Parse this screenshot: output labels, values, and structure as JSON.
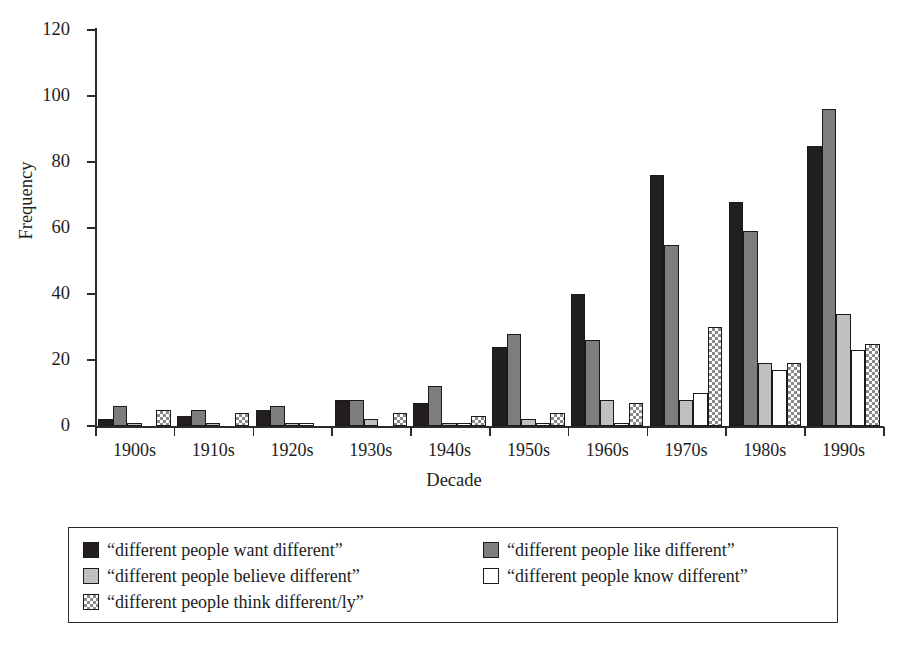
{
  "chart_data": {
    "type": "bar",
    "title": "",
    "xlabel": "Decade",
    "ylabel": "Frequency",
    "ylim": [
      0,
      120
    ],
    "yticks": [
      0,
      20,
      40,
      60,
      80,
      100,
      120
    ],
    "grid": false,
    "legend_position": "bottom",
    "categories": [
      "1900s",
      "1910s",
      "1920s",
      "1930s",
      "1940s",
      "1950s",
      "1960s",
      "1970s",
      "1980s",
      "1990s"
    ],
    "series": [
      {
        "name": "“different people want different”",
        "fill": "black",
        "color": "#231f20",
        "values": [
          2,
          3,
          5,
          8,
          7,
          24,
          40,
          76,
          68,
          85
        ]
      },
      {
        "name": "“different people like different”",
        "fill": "dark-gray",
        "color": "#7d7d7d",
        "values": [
          6,
          5,
          6,
          8,
          12,
          28,
          26,
          55,
          59,
          96
        ]
      },
      {
        "name": "“different people believe different”",
        "fill": "light-gray",
        "color": "#c0c0c0",
        "values": [
          1,
          1,
          1,
          2,
          1,
          2,
          8,
          8,
          19,
          34
        ]
      },
      {
        "name": "“different people know different”",
        "fill": "white",
        "color": "#ffffff",
        "values": [
          0,
          0,
          1,
          0,
          1,
          1,
          1,
          10,
          17,
          23
        ]
      },
      {
        "name": "“different people think different/ly”",
        "fill": "checkered",
        "color": "#8a8a8a",
        "values": [
          5,
          4,
          0,
          4,
          3,
          4,
          7,
          30,
          19,
          25
        ]
      }
    ]
  },
  "axes": {
    "y_title": "Frequency",
    "x_title": "Decade",
    "y_tick_labels": [
      "0",
      "20",
      "40",
      "60",
      "80",
      "100",
      "120"
    ],
    "x_tick_labels": [
      "1900s",
      "1910s",
      "1920s",
      "1930s",
      "1940s",
      "1950s",
      "1960s",
      "1970s",
      "1980s",
      "1990s"
    ]
  },
  "legend": {
    "left_column": [
      {
        "label": "“different people want different”",
        "swatch": "black"
      },
      {
        "label": "“different people believe different”",
        "swatch": "light-gray"
      },
      {
        "label": "“different people think different/ly”",
        "swatch": "checkered"
      }
    ],
    "right_column": [
      {
        "label": "“different people like different”",
        "swatch": "dark-gray"
      },
      {
        "label": "“different people know different”",
        "swatch": "white"
      }
    ]
  }
}
